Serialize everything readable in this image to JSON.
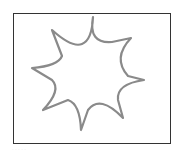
{
  "figure": {
    "shape": "eight-point-star-icon",
    "stroke_color": "#8a8a8a",
    "frame_color": "#333333",
    "caption": "· · · · ·"
  }
}
